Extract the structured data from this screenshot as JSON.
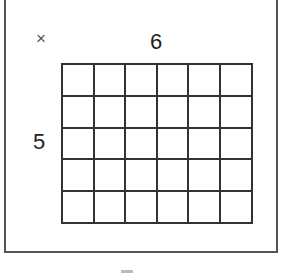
{
  "figure": {
    "operator_symbol": "×",
    "top_label": "6",
    "left_label": "5",
    "grid": {
      "columns": 6,
      "rows": 5
    }
  }
}
